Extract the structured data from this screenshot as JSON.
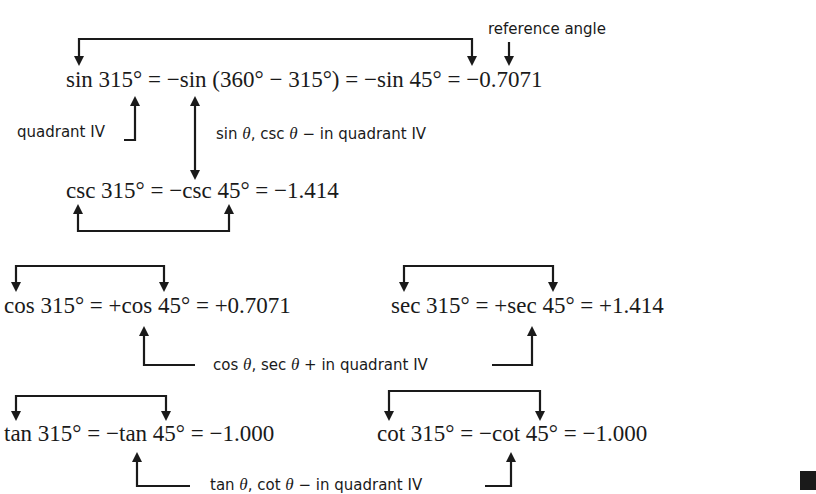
{
  "equations": {
    "sin": "sin 315° = −sin (360° − 315°) = −sin 45° = −0.7071",
    "csc": "csc 315° = −csc 45° = −1.414",
    "cos": "cos 315° = +cos 45° = +0.7071",
    "sec": "sec 315° = +sec 45° = +1.414",
    "tan": "tan 315° = −tan 45° = −1.000",
    "cot": "cot 315° = −cot 45° = −1.000"
  },
  "annotations": {
    "reference_angle": "reference angle",
    "quadrant_iv": "quadrant IV",
    "sin_csc_sign": "sin θ, csc θ − in quadrant IV",
    "cos_sec_sign": "cos θ, sec θ + in quadrant IV",
    "tan_cot_sign": "tan θ, cot θ − in quadrant IV"
  },
  "colors": {
    "ink": "#1a1a1a",
    "background": "#ffffff"
  }
}
